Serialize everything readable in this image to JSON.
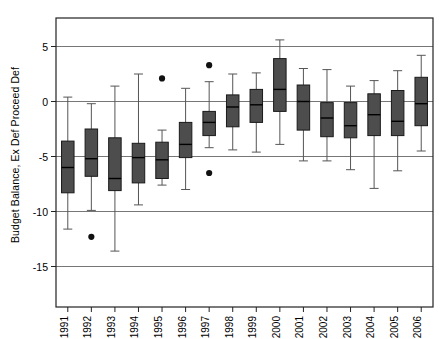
{
  "chart": {
    "ylabel": "Budget Balance, Ex Def Proceed Def",
    "xlabel": "",
    "title": ""
  },
  "axis": {
    "y_ticks": [
      "5",
      "0",
      "-5",
      "-10",
      "-15"
    ],
    "x_ticks": [
      "1991",
      "1992",
      "1993",
      "1994",
      "1995",
      "1996",
      "1997",
      "1998",
      "1999",
      "2000",
      "2001",
      "2002",
      "2003",
      "2004",
      "2005",
      "2006"
    ]
  },
  "colors": {
    "box_fill": "#4d4d4d",
    "box_edge": "#1a1a1a",
    "whisker": "#555555",
    "gridline": "#777777",
    "frame": "#222222",
    "outlier": "#111111",
    "background": "#ffffff"
  },
  "chart_data": {
    "type": "box",
    "title": "",
    "xlabel": "",
    "ylabel": "Budget Balance, Ex Def Proceed Def",
    "categories": [
      "1991",
      "1992",
      "1993",
      "1994",
      "1995",
      "1996",
      "1997",
      "1998",
      "1999",
      "2000",
      "2001",
      "2002",
      "2003",
      "2004",
      "2005",
      "2006"
    ],
    "ylim": [
      -16.0,
      6.5
    ],
    "yticks": [
      5,
      0,
      -5,
      -10,
      -15
    ],
    "gridlines": [
      5,
      0,
      -5,
      -10,
      -15
    ],
    "grid": true,
    "legend": "none",
    "boxes": [
      {
        "category": "1991",
        "whisker_low": -11.6,
        "q1": -8.3,
        "median": -6.0,
        "q3": -3.6,
        "whisker_high": 0.4,
        "outliers": []
      },
      {
        "category": "1992",
        "whisker_low": -9.9,
        "q1": -6.8,
        "median": -5.2,
        "q3": -2.5,
        "whisker_high": -0.2,
        "outliers": [
          -12.3
        ]
      },
      {
        "category": "1993",
        "whisker_low": -13.6,
        "q1": -8.1,
        "median": -7.0,
        "q3": -3.3,
        "whisker_high": 1.4,
        "outliers": []
      },
      {
        "category": "1994",
        "whisker_low": -9.4,
        "q1": -7.4,
        "median": -5.1,
        "q3": -3.8,
        "whisker_high": 2.5,
        "outliers": []
      },
      {
        "category": "1995",
        "whisker_low": -7.6,
        "q1": -7.0,
        "median": -5.3,
        "q3": -3.7,
        "whisker_high": -2.6,
        "outliers": [
          2.1
        ]
      },
      {
        "category": "1996",
        "whisker_low": -8.0,
        "q1": -5.1,
        "median": -3.9,
        "q3": -1.9,
        "whisker_high": 1.2,
        "outliers": []
      },
      {
        "category": "1997",
        "whisker_low": -4.2,
        "q1": -3.1,
        "median": -1.9,
        "q3": -0.9,
        "whisker_high": 1.8,
        "outliers": [
          3.3,
          -6.5
        ]
      },
      {
        "category": "1998",
        "whisker_low": -4.4,
        "q1": -2.3,
        "median": -0.5,
        "q3": 0.6,
        "whisker_high": 2.5,
        "outliers": []
      },
      {
        "category": "1999",
        "whisker_low": -4.6,
        "q1": -1.9,
        "median": -0.3,
        "q3": 1.1,
        "whisker_high": 2.6,
        "outliers": []
      },
      {
        "category": "2000",
        "whisker_low": -3.9,
        "q1": -0.9,
        "median": 1.1,
        "q3": 3.9,
        "whisker_high": 5.6,
        "outliers": []
      },
      {
        "category": "2001",
        "whisker_low": -5.4,
        "q1": -2.6,
        "median": 0.0,
        "q3": 1.5,
        "whisker_high": 3.0,
        "outliers": []
      },
      {
        "category": "2002",
        "whisker_low": -5.4,
        "q1": -3.2,
        "median": -1.5,
        "q3": -0.1,
        "whisker_high": 2.9,
        "outliers": []
      },
      {
        "category": "2003",
        "whisker_low": -6.2,
        "q1": -3.3,
        "median": -2.2,
        "q3": -0.1,
        "whisker_high": 1.4,
        "outliers": []
      },
      {
        "category": "2004",
        "whisker_low": -7.9,
        "q1": -3.1,
        "median": -1.2,
        "q3": 0.7,
        "whisker_high": 1.9,
        "outliers": []
      },
      {
        "category": "2005",
        "whisker_low": -6.3,
        "q1": -3.1,
        "median": -1.8,
        "q3": 1.0,
        "whisker_high": 2.8,
        "outliers": []
      },
      {
        "category": "2006",
        "whisker_low": -4.5,
        "q1": -2.2,
        "median": -0.2,
        "q3": 2.2,
        "whisker_high": 4.2,
        "outliers": []
      }
    ]
  }
}
